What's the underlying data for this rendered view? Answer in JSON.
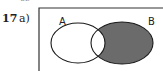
{
  "question": {
    "number": "17",
    "part": "a)",
    "cut_text": "65"
  },
  "venn": {
    "sets": [
      {
        "label": "A",
        "cx": 78,
        "cy": 43,
        "rx": 27,
        "ry": 20
      },
      {
        "label": "B",
        "cx": 122,
        "cy": 43,
        "rx": 31,
        "ry": 21
      }
    ],
    "shaded_region": "B only (B minus A)",
    "shade_color": "#6b6b6b",
    "stroke_color": "#1a1a1a"
  }
}
